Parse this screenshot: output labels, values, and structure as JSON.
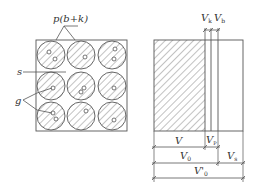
{
  "colors": {
    "stroke": "#555555",
    "text": "#333333",
    "background": "#ffffff"
  },
  "left_figure": {
    "grid": {
      "rows": 3,
      "cols": 3
    },
    "labels": {
      "particle": "p(b+k)",
      "gap": "s",
      "pores": "g"
    }
  },
  "right_figure": {
    "top_labels": {
      "vk_main": "V",
      "vk_sub": "k",
      "vb_main": "V",
      "vb_sub": "b"
    },
    "dimensions": {
      "v": "V",
      "vp_main": "V",
      "vp_sub": "P",
      "v0_main": "V",
      "v0_sub": "0",
      "vs_main": "V",
      "vs_sub": "s",
      "v0prime_main": "V'",
      "v0prime_sub": "0"
    }
  }
}
